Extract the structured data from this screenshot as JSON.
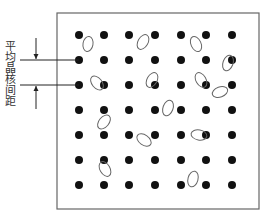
{
  "diagram": {
    "label": "平均晶核间距",
    "colors": {
      "dot": "#111111",
      "ellipse": "#666666",
      "frame": "#666666",
      "line": "#222222"
    },
    "frame": {
      "x": 57,
      "y": 13,
      "width": 202,
      "height": 196
    },
    "grid": {
      "columns_x": [
        79,
        104,
        129,
        155,
        181,
        206,
        232
      ],
      "rows_y": [
        35,
        60,
        85,
        110,
        135,
        160,
        185
      ],
      "dot_radius": 4
    },
    "dimension": {
      "upper_line_y": 60,
      "lower_line_y": 85,
      "line_x_start": 20,
      "arrow_x": 36
    },
    "ellipses": [
      {
        "cx": 88,
        "cy": 44,
        "rx": 5,
        "ry": 7.5,
        "rot": 10
      },
      {
        "cx": 143,
        "cy": 42,
        "rx": 5,
        "ry": 8,
        "rot": 30
      },
      {
        "cx": 196,
        "cy": 44,
        "rx": 5,
        "ry": 8,
        "rot": -25
      },
      {
        "cx": 228,
        "cy": 63,
        "rx": 5,
        "ry": 8,
        "rot": 20
      },
      {
        "cx": 97,
        "cy": 83,
        "rx": 5,
        "ry": 8,
        "rot": -40
      },
      {
        "cx": 152,
        "cy": 80,
        "rx": 5,
        "ry": 8,
        "rot": 30
      },
      {
        "cx": 201,
        "cy": 80,
        "rx": 5,
        "ry": 8,
        "rot": -30
      },
      {
        "cx": 220,
        "cy": 92,
        "rx": 5,
        "ry": 8,
        "rot": 70
      },
      {
        "cx": 104,
        "cy": 122,
        "rx": 5,
        "ry": 8,
        "rot": 40
      },
      {
        "cx": 168,
        "cy": 108,
        "rx": 5,
        "ry": 8,
        "rot": 20
      },
      {
        "cx": 144,
        "cy": 140,
        "rx": 5,
        "ry": 8,
        "rot": -55
      },
      {
        "cx": 199,
        "cy": 135,
        "rx": 5,
        "ry": 8,
        "rot": -80
      },
      {
        "cx": 105,
        "cy": 169,
        "rx": 5,
        "ry": 8,
        "rot": -30
      },
      {
        "cx": 193,
        "cy": 179,
        "rx": 5,
        "ry": 8,
        "rot": 15
      }
    ]
  }
}
